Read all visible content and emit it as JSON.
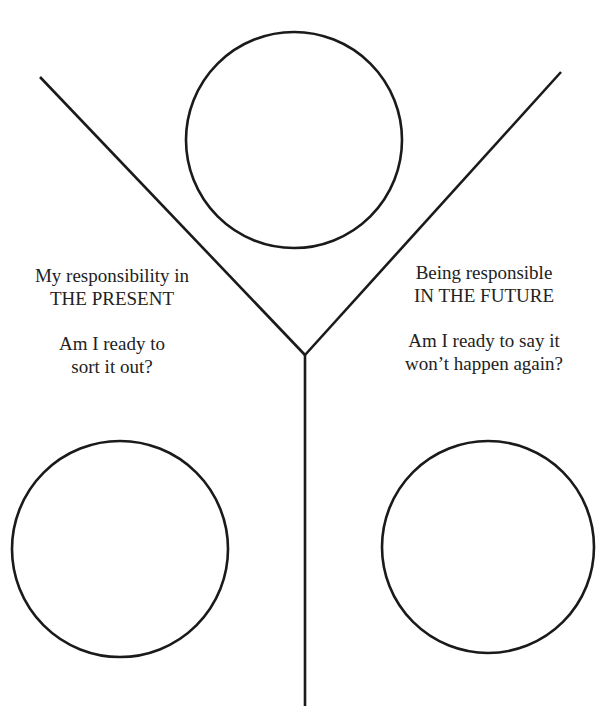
{
  "diagram": {
    "type": "Y-shaped reflection worksheet",
    "stroke_color": "#1a1a1a",
    "text_color": "#222222",
    "lines": {
      "left_branch": {
        "x1": 40,
        "y1": 77,
        "x2": 305,
        "y2": 355
      },
      "right_branch": {
        "x1": 561,
        "y1": 72,
        "x2": 305,
        "y2": 355
      },
      "stem": {
        "x1": 305,
        "y1": 355,
        "x2": 305,
        "y2": 706
      }
    },
    "circles": {
      "top": {
        "cx": 294,
        "cy": 140,
        "r": 108
      },
      "bottom_left": {
        "cx": 120,
        "cy": 549,
        "r": 108
      },
      "bottom_right": {
        "cx": 488,
        "cy": 547,
        "r": 106
      }
    },
    "left_label": {
      "line1": "My responsibility in",
      "line2": "THE PRESENT",
      "line3": "Am I ready to",
      "line4": "sort it out?"
    },
    "right_label": {
      "line1": "Being responsible",
      "line2": "IN THE FUTURE",
      "line3": "Am I ready to say it",
      "line4": "won’t happen again?"
    }
  }
}
